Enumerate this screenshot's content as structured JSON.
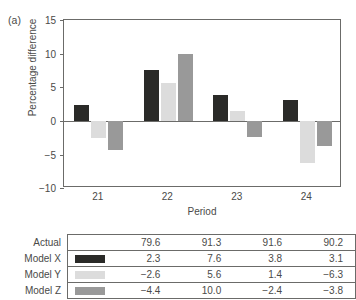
{
  "panels": {
    "a_label": "(a)",
    "b_label": "(b)"
  },
  "chart_data": {
    "type": "bar",
    "title": "",
    "xlabel": "Period",
    "ylabel": "Percentage difference",
    "categories": [
      "21",
      "22",
      "23",
      "24"
    ],
    "yticks": [
      "15",
      "10",
      "5",
      "0",
      "−5",
      "−10"
    ],
    "ylim": [
      -10,
      15
    ],
    "grid": false,
    "legend_position": "table-below",
    "series": [
      {
        "name": "Model X",
        "color": "#2a2a28",
        "values": [
          2.3,
          7.6,
          3.8,
          3.1
        ]
      },
      {
        "name": "Model Y",
        "color": "#dcdcdc",
        "values": [
          -2.6,
          5.6,
          1.4,
          -6.3
        ]
      },
      {
        "name": "Model Z",
        "color": "#999999",
        "values": [
          -4.4,
          10.0,
          -2.4,
          -3.8
        ]
      }
    ]
  },
  "table": {
    "rows": [
      {
        "label": "Actual",
        "has_swatch": false,
        "swatch_color": "",
        "values": [
          "79.6",
          "91.3",
          "91.6",
          "90.2"
        ]
      },
      {
        "label": "Model X",
        "has_swatch": true,
        "swatch_color": "#2a2a28",
        "values": [
          "2.3",
          "7.6",
          "3.8",
          "3.1"
        ]
      },
      {
        "label": "Model Y",
        "has_swatch": true,
        "swatch_color": "#dcdcdc",
        "values": [
          "−2.6",
          "5.6",
          "1.4",
          "−6.3"
        ]
      },
      {
        "label": "Model Z",
        "has_swatch": true,
        "swatch_color": "#999999",
        "values": [
          "−4.4",
          "10.0",
          "−2.4",
          "−3.8"
        ]
      }
    ]
  }
}
